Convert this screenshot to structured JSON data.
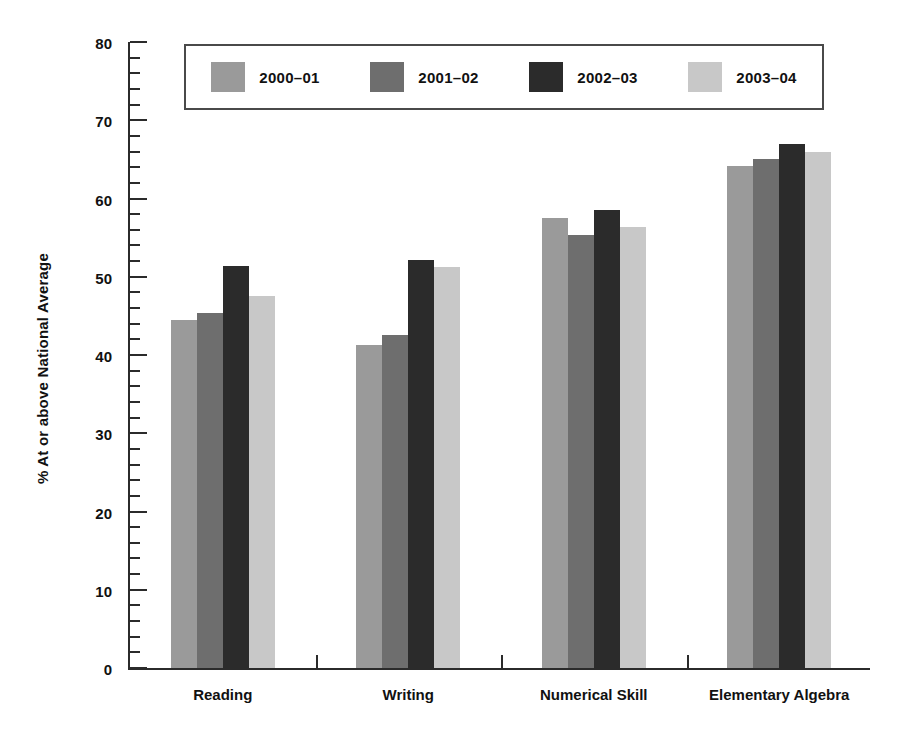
{
  "chart_data": {
    "type": "bar",
    "title": "",
    "subtitle": "",
    "xlabel": "",
    "ylabel": "% At or above National Average",
    "ylim": [
      0,
      80
    ],
    "y_major_step": 10,
    "y_minor_step": 2,
    "grid": false,
    "legend_position": "top",
    "categories": [
      "Reading",
      "Writing",
      "Numerical Skill",
      "Elementary Algebra"
    ],
    "y_tick_labels": [
      "0",
      "10",
      "20",
      "30",
      "40",
      "50",
      "60",
      "70",
      "80"
    ],
    "y_tick_values": [
      0,
      10,
      20,
      30,
      40,
      50,
      60,
      70,
      80
    ],
    "series": [
      {
        "name": "2000–01",
        "color": "#9a9a9a",
        "values": [
          44.5,
          41.3,
          57.5,
          64.2
        ]
      },
      {
        "name": "2001–02",
        "color": "#6e6e6e",
        "values": [
          45.4,
          42.5,
          55.3,
          65.0
        ]
      },
      {
        "name": "2002–03",
        "color": "#2b2b2b",
        "values": [
          51.4,
          52.2,
          58.5,
          67.0
        ]
      },
      {
        "name": "2003–04",
        "color": "#c8c8c8",
        "values": [
          47.6,
          51.2,
          56.3,
          66.0
        ]
      }
    ]
  },
  "colors": {
    "axis": "#2b2b2b",
    "legend_border": "#4a4a4a",
    "background": "#ffffff",
    "series_2000_01": "#9a9a9a",
    "series_2001_02": "#6e6e6e",
    "series_2002_03": "#2b2b2b",
    "series_2003_04": "#c8c8c8"
  }
}
